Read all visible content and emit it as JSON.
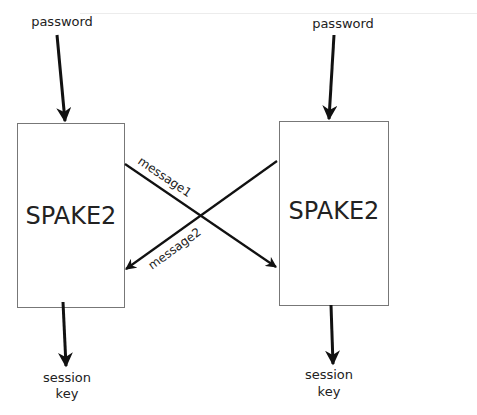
{
  "diagram": {
    "left": {
      "input_label": "password",
      "box_label": "SPAKE2",
      "output_label_line1": "session",
      "output_label_line2": "key"
    },
    "right": {
      "input_label": "password",
      "box_label": "SPAKE2",
      "output_label_line1": "session",
      "output_label_line2": "key"
    },
    "messages": [
      {
        "label": "message1",
        "from": "left",
        "to": "right"
      },
      {
        "label": "message2",
        "from": "right",
        "to": "left"
      }
    ],
    "colors": {
      "stroke": "#111111",
      "box_border": "#777777",
      "text": "#222222"
    }
  }
}
